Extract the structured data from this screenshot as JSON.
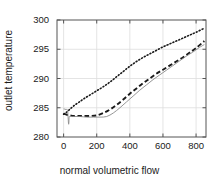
{
  "chart_data": {
    "type": "line",
    "title": "",
    "subtitle": "",
    "xlabel": "normal volumetric flow",
    "ylabel": "outlet temperature",
    "xlim": [
      -40,
      860
    ],
    "ylim": [
      280,
      300
    ],
    "xticks": [
      0,
      200,
      400,
      600,
      800
    ],
    "xtick_labels": [
      "0",
      "200",
      "400",
      "600",
      "800"
    ],
    "yticks": [
      280,
      285,
      290,
      295,
      300
    ],
    "ytick_labels": [
      "280",
      "285",
      "290",
      "295",
      "300"
    ],
    "grid": true,
    "legend": "none",
    "annotations": [],
    "series": [
      {
        "name": "dotted-upper",
        "style": "dotted",
        "color": "#1a1a1a",
        "x": [
          0,
          20,
          40,
          60,
          90,
          120,
          160,
          200,
          240,
          280,
          320,
          360,
          400,
          440,
          480,
          520,
          560,
          600,
          640,
          680,
          720,
          760,
          800,
          850
        ],
        "y": [
          283.9,
          284.3,
          284.8,
          285.3,
          285.9,
          286.5,
          287.2,
          287.9,
          288.6,
          289.4,
          290.3,
          291.2,
          292.1,
          292.9,
          293.6,
          294.2,
          294.8,
          295.4,
          295.9,
          296.4,
          296.9,
          297.4,
          297.9,
          298.6
        ]
      },
      {
        "name": "dashed-middle",
        "style": "dashed",
        "color": "#1a1a1a",
        "x": [
          0,
          20,
          40,
          60,
          90,
          120,
          160,
          200,
          240,
          280,
          320,
          360,
          400,
          440,
          480,
          520,
          560,
          600,
          640,
          680,
          720,
          760,
          800,
          850
        ],
        "y": [
          284.0,
          283.8,
          283.7,
          283.6,
          283.6,
          283.6,
          283.6,
          283.7,
          284.1,
          284.7,
          285.5,
          286.4,
          287.4,
          288.3,
          289.2,
          290.0,
          290.8,
          291.5,
          292.2,
          292.9,
          293.6,
          294.4,
          295.2,
          296.4
        ]
      },
      {
        "name": "solid-lower",
        "style": "solid",
        "color": "#8a8a8a",
        "x": [
          0,
          14,
          24,
          30,
          34,
          40,
          55,
          75,
          100,
          140,
          180,
          220,
          260,
          300,
          340,
          380,
          420,
          460,
          500,
          540,
          580,
          620,
          660,
          700,
          740,
          780,
          820,
          850
        ],
        "y": [
          284.8,
          284.7,
          284.5,
          282.2,
          283.4,
          283.5,
          283.5,
          283.5,
          283.5,
          283.4,
          283.4,
          283.4,
          283.5,
          284.1,
          285.0,
          286.0,
          287.0,
          288.0,
          288.9,
          289.8,
          290.6,
          291.4,
          292.2,
          293.0,
          293.8,
          294.5,
          295.3,
          295.8
        ]
      }
    ]
  },
  "axes_geometry": {
    "left": 57,
    "right": 206,
    "top": 20,
    "bottom": 137
  },
  "icons": {
    "plot_frame": "axes-frame"
  },
  "colors": {
    "frame": "#555555",
    "grid": "#dddddd",
    "text": "#1a1a1a",
    "solid_series": "#8a8a8a",
    "dark_series": "#1a1a1a"
  }
}
